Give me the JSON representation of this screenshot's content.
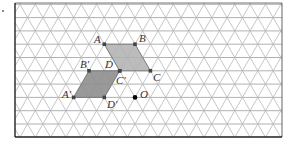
{
  "figure": {
    "bullet": {
      "x": 3,
      "y": 11
    },
    "frame": {
      "x1": 15,
      "y1": 3,
      "x2": 282,
      "y2": 137
    },
    "grid": {
      "type": "isometric-triangular",
      "origin": {
        "x": 104.3,
        "y": 44.2
      },
      "side": 15.35,
      "row_height": 13.3,
      "line_color": "#b8b8b8",
      "horizontal_color": "#a8a8a8"
    },
    "colors": {
      "original_fill": "#b0b0b0",
      "image_fill": "#8e8e8e",
      "outline": "#777777",
      "vertex": "#444444",
      "center": "#000000"
    },
    "shapes": {
      "original": {
        "name": "ABCD",
        "vertices": [
          {
            "label": "A",
            "x": 104.3,
            "y": 44.2
          },
          {
            "label": "B",
            "x": 135.0,
            "y": 44.2
          },
          {
            "label": "C",
            "x": 150.4,
            "y": 70.8
          },
          {
            "label": "D",
            "x": 119.7,
            "y": 70.8
          }
        ]
      },
      "image": {
        "name": "A'B'C'D'",
        "vertices": [
          {
            "label": "A'",
            "x": 73.6,
            "y": 97.4
          },
          {
            "label": "B'",
            "x": 89.0,
            "y": 70.8
          },
          {
            "label": "C'",
            "x": 119.7,
            "y": 70.8
          },
          {
            "label": "D'",
            "x": 104.3,
            "y": 97.4
          }
        ]
      }
    },
    "center_point": {
      "label": "O",
      "x": 135.0,
      "y": 97.4
    },
    "labels": [
      {
        "text": "A",
        "x": 94,
        "y": 43
      },
      {
        "text": "B",
        "x": 139,
        "y": 42
      },
      {
        "text": "C",
        "x": 153,
        "y": 81
      },
      {
        "text": "D",
        "x": 105,
        "y": 68
      },
      {
        "text": "C'",
        "x": 116,
        "y": 84
      },
      {
        "text": "B'",
        "x": 80,
        "y": 68
      },
      {
        "text": "A'",
        "x": 62,
        "y": 98
      },
      {
        "text": "D'",
        "x": 107,
        "y": 108
      },
      {
        "text": "O",
        "x": 140,
        "y": 98
      }
    ]
  }
}
